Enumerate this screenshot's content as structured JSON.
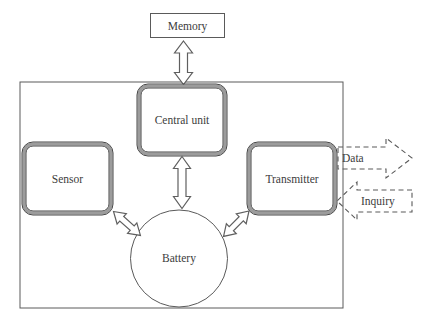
{
  "diagram": {
    "nodes": {
      "memory": {
        "label": "Memory",
        "shape": "rectangle"
      },
      "central_unit": {
        "label": "Central unit",
        "shape": "rounded-rectangle"
      },
      "sensor": {
        "label": "Sensor",
        "shape": "rounded-rectangle"
      },
      "transmitter": {
        "label": "Transmitter",
        "shape": "rounded-rectangle"
      },
      "battery": {
        "label": "Battery",
        "shape": "circle"
      }
    },
    "external_flows": {
      "data": {
        "label": "Data",
        "direction": "outgoing",
        "style": "dashed-block-arrow"
      },
      "inquiry": {
        "label": "Inquiry",
        "direction": "incoming",
        "style": "dashed-block-arrow"
      }
    },
    "connections": [
      {
        "from": "Memory",
        "to": "Central unit",
        "type": "bidirectional-block-arrow"
      },
      {
        "from": "Central unit",
        "to": "Battery",
        "type": "bidirectional-block-arrow"
      },
      {
        "from": "Sensor",
        "to": "Battery",
        "type": "bidirectional-block-arrow"
      },
      {
        "from": "Transmitter",
        "to": "Battery",
        "type": "bidirectional-block-arrow"
      },
      {
        "from": "Transmitter",
        "to": "external",
        "label": "Data",
        "type": "dashed-block-arrow"
      },
      {
        "from": "external",
        "to": "Transmitter",
        "label": "Inquiry",
        "type": "dashed-block-arrow"
      }
    ],
    "colors": {
      "background": "#ffffff",
      "line": "#5a5a5a",
      "box_border_band": "#9c9c9c",
      "text": "#3c3c3c"
    }
  }
}
